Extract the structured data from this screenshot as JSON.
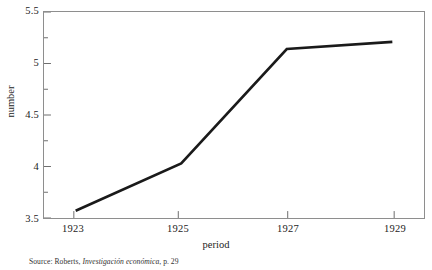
{
  "chart_data": {
    "type": "line",
    "title": "",
    "subtitle": "",
    "xlabel": "period",
    "ylabel": "number",
    "x": [
      1923,
      1925,
      1927,
      1929
    ],
    "values": [
      3.57,
      4.03,
      5.14,
      5.21
    ],
    "series": [
      {
        "name": "number",
        "x": [
          1923,
          1925,
          1927,
          1929
        ],
        "values": [
          3.57,
          4.03,
          5.14,
          5.21
        ]
      }
    ],
    "xlim": [
      1922.4,
      1929.6
    ],
    "ylim": [
      3.5,
      5.5
    ],
    "xticks": [
      1923,
      1925,
      1927,
      1929
    ],
    "xtick_labels": [
      "1923",
      "1925",
      "1927",
      "1929"
    ],
    "yticks": [
      3.5,
      4,
      4.5,
      5,
      5.5
    ],
    "ytick_labels": [
      "3.5",
      "4",
      "4.5",
      "5",
      "5.5"
    ],
    "y_minor_ticks": [
      3.75,
      4.25,
      4.75,
      5.25
    ],
    "grid": false,
    "legend": false,
    "legend_position": "none",
    "line_color": "#1a1a1a",
    "frame_color": "#8e8e8e",
    "background": "#ffffff"
  },
  "axes": {
    "y_title": "number",
    "x_title": "period",
    "y_tick_labels": [
      "5.5",
      "5",
      "4.5",
      "4",
      "3.5"
    ],
    "x_tick_labels": [
      "1923",
      "1925",
      "1927",
      "1929"
    ]
  },
  "caption": {
    "prefix": "Source: Roberts, ",
    "italic_title": "Investigación económica",
    "suffix": ", p. 29",
    "full_text": "Source: Roberts, Investigación económica, p. 29"
  }
}
